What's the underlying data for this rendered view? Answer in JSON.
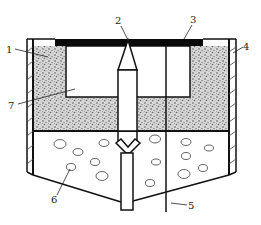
{
  "diagram": {
    "type": "technical-schematic",
    "colors": {
      "line": "#111111",
      "plate": "#0a0a0a",
      "fill_granular": "#bdbdbd",
      "background": "#ffffff"
    },
    "labels": [
      {
        "id": "1",
        "text": "1"
      },
      {
        "id": "2",
        "text": "2"
      },
      {
        "id": "3",
        "text": "3"
      },
      {
        "id": "4",
        "text": "4"
      },
      {
        "id": "5",
        "text": "5"
      },
      {
        "id": "6",
        "text": "6"
      },
      {
        "id": "7",
        "text": "7"
      }
    ]
  }
}
